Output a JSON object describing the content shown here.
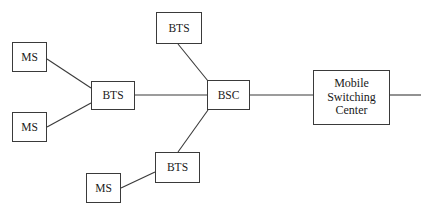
{
  "diagram": {
    "type": "network-topology",
    "nodes": [
      {
        "id": "ms-top-left",
        "label": "MS",
        "x": 12,
        "y": 42,
        "w": 35,
        "h": 30,
        "kind": "ms"
      },
      {
        "id": "ms-bottom-left",
        "label": "MS",
        "x": 12,
        "y": 112,
        "w": 35,
        "h": 30,
        "kind": "ms"
      },
      {
        "id": "ms-bottom",
        "label": "MS",
        "x": 86,
        "y": 173,
        "w": 35,
        "h": 30,
        "kind": "ms"
      },
      {
        "id": "bts-left",
        "label": "BTS",
        "x": 91,
        "y": 81,
        "w": 44,
        "h": 29,
        "kind": "bts"
      },
      {
        "id": "bts-top",
        "label": "BTS",
        "x": 156,
        "y": 12,
        "w": 46,
        "h": 32,
        "kind": "bts"
      },
      {
        "id": "bts-bottom",
        "label": "BTS",
        "x": 155,
        "y": 152,
        "w": 45,
        "h": 31,
        "kind": "bts"
      },
      {
        "id": "bsc",
        "label": "BSC",
        "x": 207,
        "y": 80,
        "w": 43,
        "h": 30,
        "kind": "bsc"
      },
      {
        "id": "msc",
        "label": "Mobile\nSwitching\nCenter",
        "x": 313,
        "y": 70,
        "w": 77,
        "h": 55,
        "kind": "msc"
      }
    ],
    "edges": [
      {
        "id": "edge-ms-top-left-to-bts-left",
        "from": "ms-top-left",
        "to": "bts-left",
        "x1": 47,
        "y1": 59,
        "x2": 91,
        "y2": 88
      },
      {
        "id": "edge-ms-bottom-left-to-bts-left",
        "from": "ms-bottom-left",
        "to": "bts-left",
        "x1": 47,
        "y1": 127,
        "x2": 91,
        "y2": 103
      },
      {
        "id": "edge-bts-left-to-bsc",
        "from": "bts-left",
        "to": "bsc",
        "x1": 135,
        "y1": 95,
        "x2": 207,
        "y2": 95
      },
      {
        "id": "edge-bts-top-to-bsc",
        "from": "bts-top",
        "to": "bsc",
        "x1": 178,
        "y1": 44,
        "x2": 208,
        "y2": 81
      },
      {
        "id": "edge-bts-bottom-to-bsc",
        "from": "bts-bottom",
        "to": "bsc",
        "x1": 178,
        "y1": 152,
        "x2": 208,
        "y2": 110
      },
      {
        "id": "edge-ms-bottom-to-bts-bottom",
        "from": "ms-bottom",
        "to": "bts-bottom",
        "x1": 121,
        "y1": 188,
        "x2": 155,
        "y2": 172
      },
      {
        "id": "edge-bsc-to-msc",
        "from": "bsc",
        "to": "msc",
        "x1": 250,
        "y1": 95,
        "x2": 313,
        "y2": 95
      },
      {
        "id": "edge-msc-to-network",
        "from": "msc",
        "to": "network",
        "x1": 390,
        "y1": 95,
        "x2": 421,
        "y2": 95
      }
    ],
    "colors": {
      "line": "#3a3a3a",
      "box_border": "#3a3a3a",
      "background": "#ffffff",
      "text": "#1a1a1a"
    }
  }
}
